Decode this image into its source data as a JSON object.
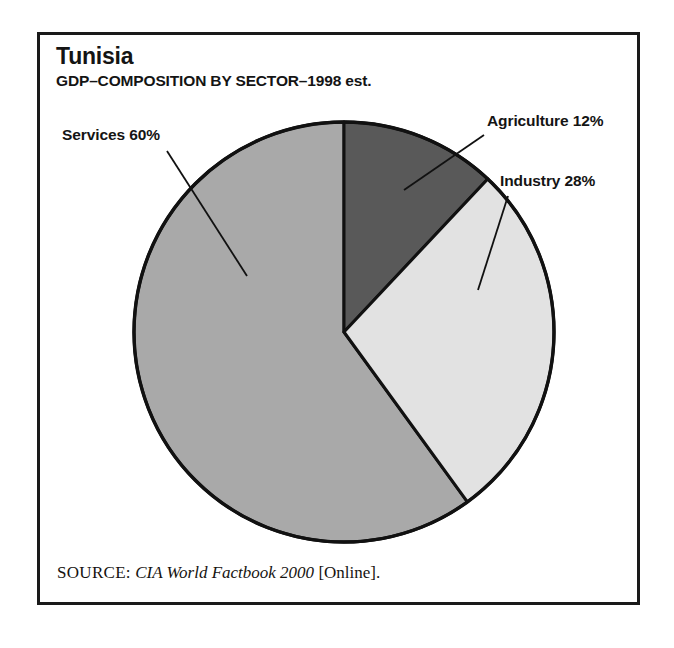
{
  "figure": {
    "title": "Tunisia",
    "subtitle": "GDP–COMPOSITION BY SECTOR–1998 est.",
    "source_prefix": "SOURCE:",
    "source_title": "CIA World Factbook 2000",
    "source_suffix": "[Online].",
    "frame_color": "#1a1a1a",
    "background_color": "#ffffff"
  },
  "labels": {
    "services": "Services 60%",
    "agriculture": "Agriculture 12%",
    "industry": "Industry 28%"
  },
  "chart_data": {
    "type": "pie",
    "title": "Tunisia",
    "subtitle": "GDP–COMPOSITION BY SECTOR–1998 est.",
    "xlabel": "",
    "ylabel": "",
    "unit": "percent",
    "total": 100,
    "start_angle_deg": 0,
    "direction": "clockwise",
    "legend_position": "callout-labels",
    "grid": false,
    "categories": [
      "Agriculture",
      "Industry",
      "Services"
    ],
    "values": [
      12,
      28,
      60
    ],
    "slices": [
      {
        "name": "Agriculture",
        "value": 12,
        "label": "Agriculture 12%",
        "color": "#595959",
        "start_angle_deg": 0,
        "end_angle_deg": 43.2
      },
      {
        "name": "Industry",
        "value": 28,
        "label": "Industry 28%",
        "color": "#e2e2e2",
        "start_angle_deg": 43.2,
        "end_angle_deg": 144
      },
      {
        "name": "Services",
        "value": 60,
        "label": "Services 60%",
        "color": "#a9a9a9",
        "start_angle_deg": 144,
        "end_angle_deg": 360
      }
    ],
    "annotations": [
      "Agriculture 12%",
      "Industry 28%",
      "Services 60%"
    ],
    "source": "CIA World Factbook 2000 [Online]."
  }
}
